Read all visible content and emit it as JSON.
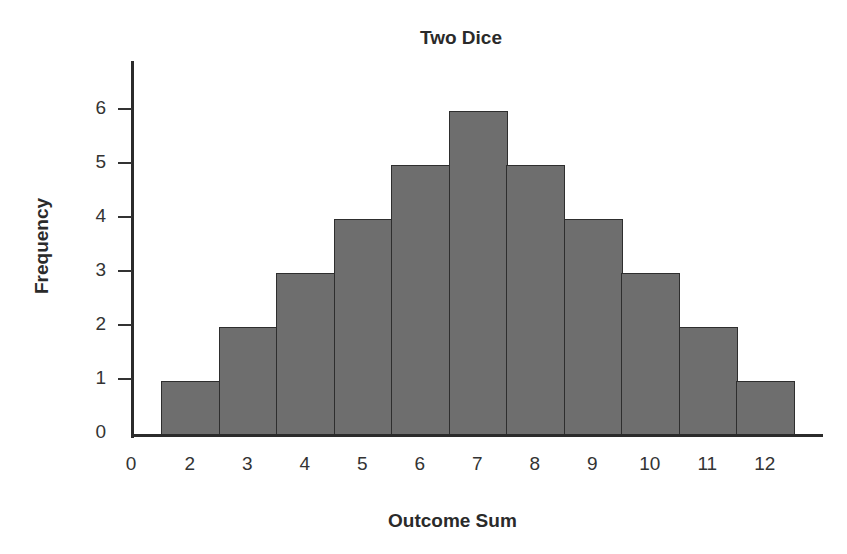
{
  "chart_data": {
    "type": "bar",
    "title": "Two Dice",
    "xlabel": "Outcome Sum",
    "ylabel": "Frequency",
    "categories": [
      "2",
      "3",
      "4",
      "5",
      "6",
      "7",
      "8",
      "9",
      "10",
      "11",
      "12"
    ],
    "values": [
      1,
      2,
      3,
      4,
      5,
      6,
      5,
      4,
      3,
      2,
      1
    ],
    "x_tick_labels": [
      "0",
      "2",
      "3",
      "4",
      "5",
      "6",
      "7",
      "8",
      "9",
      "10",
      "11",
      "12"
    ],
    "y_tick_labels": [
      "0",
      "1",
      "2",
      "3",
      "4",
      "5",
      "6"
    ],
    "ylim": [
      0,
      6.8
    ],
    "grid": false,
    "legend": null,
    "bar_color": "#6e6e6e",
    "bar_edge_color": "#2e2e2e"
  }
}
